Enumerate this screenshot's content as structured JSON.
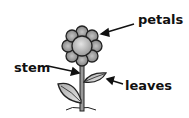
{
  "diagram": {
    "labels": {
      "petals": "petals",
      "stem": "stem",
      "leaves": "leaves"
    }
  }
}
